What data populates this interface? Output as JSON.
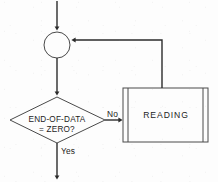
{
  "diagram": {
    "type": "flowchart",
    "colors": {
      "background": "#fdfdfd",
      "shape_outline": "#4a4a4a",
      "connector_line": "#2b2b2b",
      "text": "#1c1c1c"
    },
    "nodes": {
      "connector": {
        "shape": "circle",
        "label": ""
      },
      "decision": {
        "shape": "diamond",
        "line1": "END-OF-DATA",
        "line2": "= ZERO?"
      },
      "process": {
        "shape": "predefined-process",
        "label": "READING"
      }
    },
    "edges": {
      "entry_label": "",
      "no_label": "No",
      "yes_label": "Yes",
      "feedback_label": ""
    }
  }
}
